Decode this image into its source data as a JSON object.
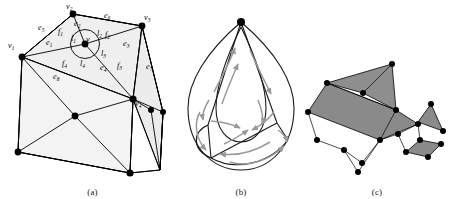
{
  "figure": {
    "panels": [
      {
        "id": "a",
        "caption": "(a)",
        "description": "Triangulated polyhedral mesh (cube) with labeled vertices, edges and faces around a central vertex v",
        "fill_color": "#efefef",
        "stroke_color": "#000000",
        "vertex_labels": [
          {
            "name": "v1",
            "base": "v",
            "sub": "1"
          },
          {
            "name": "v2",
            "base": "v",
            "sub": "2"
          },
          {
            "name": "v3",
            "base": "v",
            "sub": "3"
          },
          {
            "name": "v4",
            "base": "v",
            "sub": "4"
          },
          {
            "name": "v",
            "base": "v",
            "sub": ""
          }
        ],
        "edge_labels": [
          {
            "base": "e",
            "sub": "1"
          },
          {
            "base": "e",
            "sub": "2"
          },
          {
            "base": "e",
            "sub": "3"
          },
          {
            "base": "e",
            "sub": "4"
          },
          {
            "base": "e",
            "sub": "5"
          },
          {
            "base": "e",
            "sub": "6"
          },
          {
            "base": "e",
            "sub": "7"
          },
          {
            "base": "e",
            "sub": "8"
          }
        ],
        "face_labels": [
          {
            "base": "f",
            "sub": "1"
          },
          {
            "base": "f",
            "sub": "2"
          },
          {
            "base": "f",
            "sub": "3"
          },
          {
            "base": "f",
            "sub": "4"
          }
        ],
        "link_labels": [
          {
            "base": "l",
            "sub": "1"
          },
          {
            "base": "l",
            "sub": "2"
          },
          {
            "base": "l",
            "sub": "3"
          },
          {
            "base": "l",
            "sub": "4"
          }
        ]
      },
      {
        "id": "b",
        "caption": "(b)",
        "description": "Teardrop-shaped planar graph with gray directed arrow cycles on each face",
        "stroke_color": "#1a1a1a",
        "arrow_color": "#9a9a9a"
      },
      {
        "id": "c",
        "caption": "(c)",
        "description": "Exploded 3D view of shaded gray polygonal facets connected by thin linking edges",
        "fill_color": "#8a8a8a",
        "stroke_color": "#000000"
      }
    ]
  }
}
